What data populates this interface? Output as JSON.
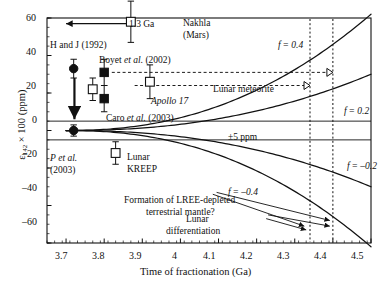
{
  "figure": {
    "domain": "scientific-plot",
    "background": "#ffffff",
    "ink": "#111111"
  },
  "chart_data": {
    "type": "scatter",
    "title": "",
    "xlabel": "Time of fractionation (Ga)",
    "ylabel": "ε142 × 100 (ppm)",
    "ylabel_parts": {
      "eps": "ε",
      "sub": "142",
      "rest": " × 100 (ppm)"
    },
    "xlim": [
      3.65,
      4.5
    ],
    "ylim": [
      -60,
      60
    ],
    "xticks": [
      3.7,
      3.8,
      3.9,
      4.0,
      4.1,
      4.2,
      4.3,
      4.4,
      4.5
    ],
    "xticklabels": [
      "3.7",
      "3.8",
      "3.9",
      "4",
      "4.1",
      "4.2",
      "4.3",
      "4.4",
      "4.5"
    ],
    "x_minor_step": 0.02,
    "yticks": [
      -60,
      -40,
      -20,
      0,
      20,
      40,
      60
    ],
    "yticklabels": [
      "−60",
      "−40",
      "−20",
      "0",
      "20",
      "40",
      "60"
    ],
    "y_minor_step": 5,
    "grid": false,
    "legend": "none",
    "points": [
      {
        "name": "nakhla-mars",
        "x": 3.87,
        "y": 58,
        "yerr": 11,
        "marker": "open-square",
        "label": "Nakhla\n(Mars)"
      },
      {
        "name": "h-and-j-1992",
        "x": 3.72,
        "y": 33,
        "yerr": 5,
        "marker": "filled-circle",
        "label": "H and J (1992)"
      },
      {
        "name": "boyet-upper",
        "x": 3.8,
        "y": 31,
        "yerr": 7,
        "marker": "filled-square",
        "label": "Boyet et al. (2002)"
      },
      {
        "name": "boyet-lower",
        "x": 3.8,
        "y": 17,
        "yerr": 7,
        "marker": "filled-square",
        "label": "Caro et al. (2003)"
      },
      {
        "name": "caro-2003",
        "x": 3.77,
        "y": 22,
        "yerr": 6,
        "marker": "open-square",
        "label": "Caro et al. (2003)"
      },
      {
        "name": "lunar-meteorite",
        "x": 3.92,
        "y": 26,
        "yerr": 9,
        "marker": "open-square",
        "label": "Lunar meteorite"
      },
      {
        "name": "p-et-al-2003",
        "x": 3.72,
        "y": 0,
        "yerr": 3,
        "marker": "filled-circle",
        "label": "P et al. (2003)"
      },
      {
        "name": "lunar-kreep",
        "x": 3.83,
        "y": -12,
        "yerr": 6,
        "marker": "open-square",
        "label": "Lunar KREEP"
      }
    ],
    "curves": [
      {
        "name": "f-0.4",
        "f": 0.4,
        "label": "f = 0.4",
        "x_start": 3.7,
        "y_at_4_5": 62
      },
      {
        "name": "f-0.2",
        "f": 0.2,
        "label": "f = 0.2",
        "x_start": 3.7,
        "y_at_4_5": 30
      },
      {
        "name": "f--0.2",
        "f": -0.2,
        "label": "f = −0.2",
        "x_start": 3.7,
        "y_at_4_5": -30
      },
      {
        "name": "f--0.4",
        "f": -0.4,
        "label": "f = −0.4",
        "x_start": 3.7,
        "y_at_4_5": -62
      }
    ],
    "horizontal_lines": [
      {
        "name": "plus-5-ppm",
        "y": 5,
        "label": "±5 ppm"
      },
      {
        "name": "minus-5-ppm",
        "y": -5,
        "label": ""
      }
    ],
    "vertical_guides": [
      {
        "name": "lunar-differentiation-4.34",
        "x": 4.34,
        "style": "dotted"
      },
      {
        "name": "lunar-differentiation-4.40",
        "x": 4.4,
        "style": "dotted"
      }
    ],
    "dashed_projections": [
      {
        "name": "projection-upper",
        "y": 31,
        "x_from": 3.82,
        "x_to": 4.4
      },
      {
        "name": "projection-lower",
        "y": 24,
        "x_from": 3.88,
        "x_to": 4.34
      }
    ],
    "annotations": [
      {
        "name": "age-arrow-1.3ga",
        "label": "1.3 Ga",
        "x": 3.79,
        "y": 57,
        "direction": "left"
      },
      {
        "name": "downward-arrow",
        "label": "",
        "x": 3.72,
        "y_from": 30,
        "y_to": 3
      },
      {
        "name": "lree-note",
        "label": "Formation of LREE-depleted\nterrestrial mantle?"
      },
      {
        "name": "lunar-diff-note",
        "label": "Lunar\ndifferentiation"
      },
      {
        "name": "apollo-17",
        "label": "Apollo 17"
      }
    ]
  },
  "labels": {
    "y_axis_eps": "ε",
    "y_axis_sub": "142",
    "y_axis_rest": "× 100 (ppm)",
    "x_axis": "Time of fractionation (Ga)",
    "nakhla_line1": "Nakhla",
    "nakhla_line2": "(Mars)",
    "age_13ga": "1.3 Ga",
    "h_and_j": "H and J (1992)",
    "boyet": "Boyet",
    "boyet_ital": "et al.",
    "boyet_year": "(2002)",
    "caro": "Caro",
    "caro_ital": "et al.",
    "caro_year": "(2003)",
    "p_et_al": "P",
    "p_ital": "et al.",
    "p_year": "(2003)",
    "lunar_meteorite": "Lunar meteorite",
    "apollo17": "Apollo 17",
    "lunar_kreep_l1": "Lunar",
    "lunar_kreep_l2": "KREEP",
    "ppm_band": "±5 ppm",
    "f_04": "f = 0.4",
    "f_02": "f = 0.2",
    "f_m02": "f = –0.2",
    "f_m04": "f = –0.4",
    "lree_l1": "Formation of LREE-depleted",
    "lree_l2": "terrestrial mantle?",
    "lunar_diff_l1": "Lunar",
    "lunar_diff_l2": "differentiation",
    "xt_0": "3.7",
    "xt_1": "3.8",
    "xt_2": "3.9",
    "xt_3": "4",
    "xt_4": "4.1",
    "xt_5": "4.2",
    "xt_6": "4.3",
    "xt_7": "4.4",
    "xt_8": "4.5",
    "yt_60": "60",
    "yt_40": "40",
    "yt_20": "20",
    "yt_0": "0",
    "yt_m20": "–20",
    "yt_m40": "–40",
    "yt_m60": "–60"
  }
}
